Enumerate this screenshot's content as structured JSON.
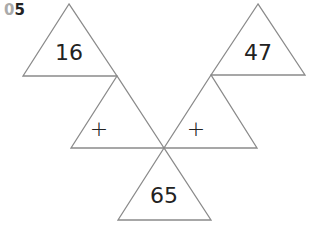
{
  "question": {
    "number_prefix": "0",
    "number_suffix": "5"
  },
  "triangles": {
    "top_left": {
      "value": "16"
    },
    "top_right": {
      "value": "47"
    },
    "middle_left": {
      "operator": "+"
    },
    "middle_right": {
      "operator": "+"
    },
    "bottom": {
      "value": "65"
    }
  },
  "colors": {
    "stroke": "#8a8a8a",
    "text": "#222222",
    "prefix": "#aaaaaa"
  }
}
